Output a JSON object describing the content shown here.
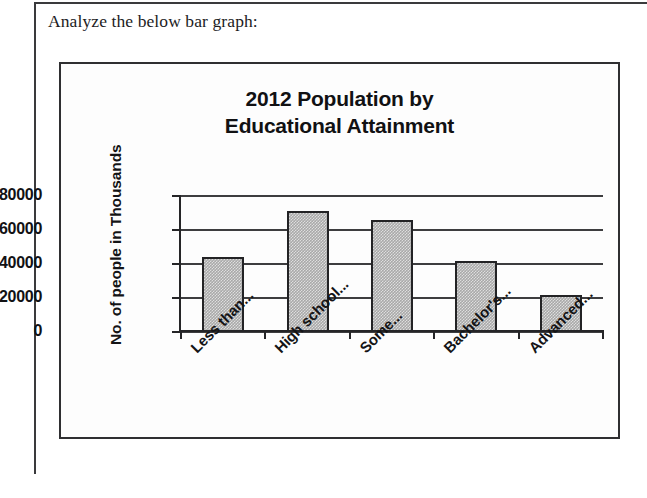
{
  "document": {
    "header_text": "Analyze the below bar graph:"
  },
  "chart_data": {
    "type": "bar",
    "title": "2012 Population by Educational Attainment",
    "title_lines": [
      "2012 Population by",
      "Educational Attainment"
    ],
    "xlabel": "",
    "ylabel": "No. of people in Thousands",
    "categories": [
      "Less than...",
      "High school...",
      "Some...",
      "Bachelor's...",
      "Advanced..."
    ],
    "values": [
      44000,
      71000,
      66000,
      42000,
      22000
    ],
    "ylim": [
      0,
      80000
    ],
    "yticks": [
      0,
      20000,
      40000,
      60000,
      80000
    ],
    "ytick_labels": [
      "0",
      "20000",
      "40000",
      "60000",
      "80000"
    ],
    "grid": true,
    "legend": false,
    "bar_color": "#a9a9a9",
    "bar_edge_color": "#232325",
    "axis_color": "#252527"
  }
}
